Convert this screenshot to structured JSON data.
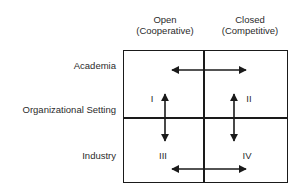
{
  "diagram": {
    "title_axis_y": "Organizational Setting",
    "columns": [
      {
        "label": "Open",
        "sublabel": "(Cooperative)"
      },
      {
        "label": "Closed",
        "sublabel": "(Competitive)"
      }
    ],
    "rows": [
      {
        "label": "Academia"
      },
      {
        "label": "Industry"
      }
    ],
    "quadrants": [
      {
        "numeral": "I",
        "row": "Academia",
        "column": "Open"
      },
      {
        "numeral": "II",
        "row": "Academia",
        "column": "Closed"
      },
      {
        "numeral": "III",
        "row": "Industry",
        "column": "Open"
      },
      {
        "numeral": "IV",
        "row": "Industry",
        "column": "Closed"
      }
    ],
    "arrows": [
      {
        "name": "top-horizontal-arrow",
        "orientation": "horizontal",
        "double_headed": true
      },
      {
        "name": "bottom-horizontal-arrow",
        "orientation": "horizontal",
        "double_headed": true
      },
      {
        "name": "left-vertical-arrow",
        "orientation": "vertical",
        "double_headed": true
      },
      {
        "name": "right-vertical-arrow",
        "orientation": "vertical",
        "double_headed": true
      }
    ],
    "colors": {
      "line": "#1a1a1a",
      "text": "#2b2b2b",
      "background": "#ffffff"
    }
  }
}
